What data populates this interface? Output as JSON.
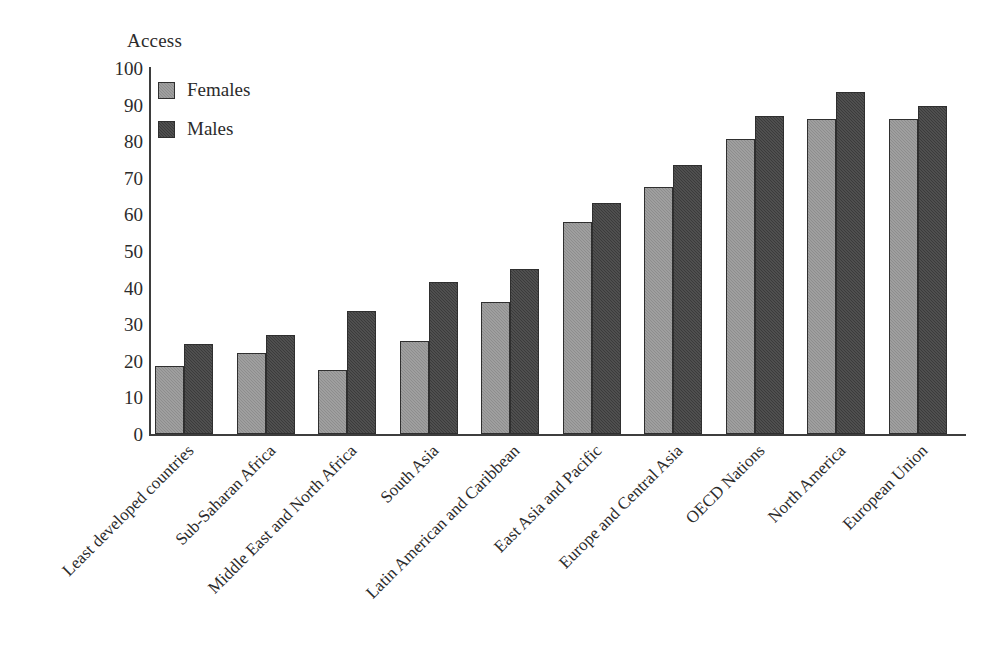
{
  "chart_data": {
    "type": "bar",
    "title": "Access",
    "xlabel": "",
    "ylabel": "Access",
    "ylim": [
      0,
      100
    ],
    "yticks": [
      0,
      10,
      20,
      30,
      40,
      50,
      60,
      70,
      80,
      90,
      100
    ],
    "grid": false,
    "legend_position": "top-left",
    "categories": [
      "Least developed countries",
      "Sub-Saharan Africa",
      "Middle East and North Africa",
      "South Asia",
      "Latin American and Caribbean",
      "East Asia and Pacific",
      "Europe and Central Asia",
      "OECD Nations",
      "North America",
      "European Union"
    ],
    "series": [
      {
        "name": "Females",
        "color": "#8d8d8d",
        "values": [
          18.5,
          22,
          17.5,
          25.5,
          36,
          58,
          67.5,
          80.5,
          86,
          86
        ]
      },
      {
        "name": "Males",
        "color": "#3b3b3b",
        "values": [
          24.5,
          27,
          33.5,
          41.5,
          45,
          63,
          73.5,
          87,
          93.5,
          89.5
        ]
      }
    ]
  },
  "legend": {
    "items": [
      {
        "label": "Females",
        "swatch": "female"
      },
      {
        "label": "Males",
        "swatch": "male"
      }
    ]
  }
}
